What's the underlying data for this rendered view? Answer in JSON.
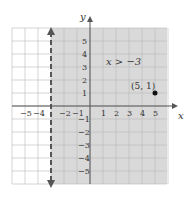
{
  "chart_data": {
    "type": "line",
    "title": "",
    "xlabel": "x",
    "ylabel": "y",
    "xlim": [
      -6,
      6
    ],
    "ylim": [
      -6,
      6
    ],
    "grid": true,
    "x_tick_labels": [
      "-5",
      "-4",
      "-2",
      "-1",
      "1",
      "2",
      "3",
      "4",
      "5"
    ],
    "y_tick_labels": [
      "5",
      "4",
      "3",
      "2",
      "1",
      "-1",
      "-2",
      "-3",
      "-4",
      "-5"
    ],
    "boundary": {
      "type": "vertical-dashed",
      "x": -3
    },
    "shaded_region": "x > -3",
    "inequality_label": "x > −3",
    "points": [
      {
        "x": 5,
        "y": 1,
        "label": "(5, 1)"
      }
    ],
    "colors": {
      "shade": "#d9d9d9",
      "grid": "#b0b0b0",
      "axis": "#555555",
      "boundary": "#555555"
    }
  }
}
